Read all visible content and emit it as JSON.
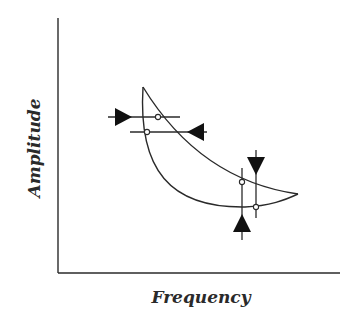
{
  "diagram": {
    "type": "hysteresis-frequency-response",
    "xlabel": "Frequency",
    "ylabel": "Amplitude",
    "colors": {
      "line": "#2a2a2a",
      "background": "#ffffff"
    },
    "axes": {
      "origin": [
        58,
        273
      ],
      "x_end": 340,
      "y_end": 18
    },
    "curve": {
      "apex": [
        143,
        87
      ],
      "tip": [
        298,
        194
      ],
      "upper_branch": "M143,87 Q200,180 298,194",
      "lower_branch": "M143,87 Q140,210 250,207 Q280,204 298,194"
    },
    "jumps": [
      {
        "name": "jump-up-left",
        "orientation": "horizontal",
        "y": 117,
        "x1": 108,
        "x2": 180,
        "point": [
          158,
          117
        ],
        "arrow": "right",
        "arrow_x": 115
      },
      {
        "name": "jump-down-left",
        "orientation": "horizontal",
        "y": 132,
        "x1": 130,
        "x2": 207,
        "point": [
          147,
          132
        ],
        "arrow": "left",
        "arrow_x": 204
      },
      {
        "name": "jump-up-right",
        "orientation": "vertical",
        "x": 242,
        "y1": 168,
        "y2": 240,
        "point": [
          242,
          182
        ],
        "arrow": "up",
        "arrow_y": 232
      },
      {
        "name": "jump-down-right",
        "orientation": "vertical",
        "x": 256,
        "y1": 150,
        "y2": 218,
        "point": [
          256,
          207
        ],
        "arrow": "down",
        "arrow_y": 158
      }
    ]
  }
}
